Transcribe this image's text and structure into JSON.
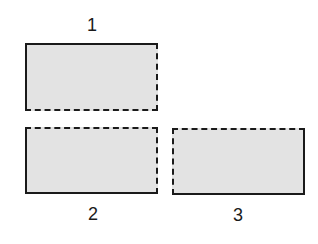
{
  "diagram": {
    "fill_color": "#e3e3e3",
    "stroke_color": "#1a1a1a",
    "pieces": [
      {
        "label": "1",
        "solid_edges": [
          "top",
          "left"
        ],
        "dashed_edges": [
          "right",
          "bottom"
        ]
      },
      {
        "label": "2",
        "solid_edges": [
          "left",
          "bottom"
        ],
        "dashed_edges": [
          "top",
          "right"
        ]
      },
      {
        "label": "3",
        "solid_edges": [
          "top",
          "right",
          "bottom"
        ],
        "dashed_edges": [
          "left"
        ]
      }
    ]
  }
}
